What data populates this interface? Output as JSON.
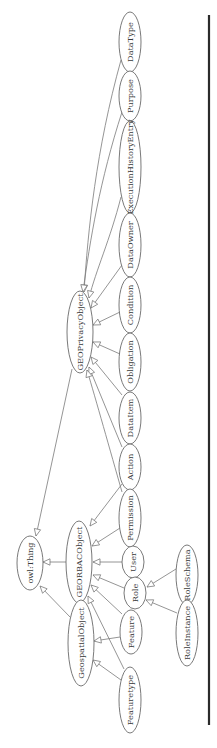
{
  "diagram": {
    "type": "class-hierarchy",
    "orientation": "rotated-90-ccw",
    "root": "owl:Thing",
    "nodes": [
      {
        "id": "owl_thing",
        "label": "owl:Thing",
        "cx": 30,
        "cy": 563,
        "rx": 13,
        "ry": 27
      },
      {
        "id": "geoprivacyobject",
        "label": "GEOPrivacyObject",
        "cx": 80,
        "cy": 332,
        "rx": 13,
        "ry": 41
      },
      {
        "id": "georbacobject",
        "label": "GEORBACObject",
        "cx": 79,
        "cy": 562,
        "rx": 13,
        "ry": 41
      },
      {
        "id": "geospatialobject",
        "label": "GeospatialObject",
        "cx": 81,
        "cy": 643,
        "rx": 13,
        "ry": 43
      },
      {
        "id": "datatype",
        "label": "DataType",
        "cx": 130,
        "cy": 42,
        "rx": 11,
        "ry": 30
      },
      {
        "id": "purpose",
        "label": "Purpose",
        "cx": 130,
        "cy": 96,
        "rx": 11,
        "ry": 25
      },
      {
        "id": "executionhistoryentry",
        "label": "ExecutionHistoryEntry",
        "cx": 130,
        "cy": 167,
        "rx": 11,
        "ry": 46
      },
      {
        "id": "dataowner",
        "label": "DataOwner",
        "cx": 130,
        "cy": 245,
        "rx": 11,
        "ry": 32
      },
      {
        "id": "condition",
        "label": "Condition",
        "cx": 130,
        "cy": 305,
        "rx": 11,
        "ry": 28
      },
      {
        "id": "obligation",
        "label": "Obligation",
        "cx": 130,
        "cy": 362,
        "rx": 11,
        "ry": 29
      },
      {
        "id": "dataitem",
        "label": "DataItem",
        "cx": 130,
        "cy": 418,
        "rx": 11,
        "ry": 26
      },
      {
        "id": "action",
        "label": "Action",
        "cx": 130,
        "cy": 467,
        "rx": 11,
        "ry": 23
      },
      {
        "id": "permission",
        "label": "Permission",
        "cx": 130,
        "cy": 518,
        "rx": 11,
        "ry": 29
      },
      {
        "id": "user",
        "label": "User",
        "cx": 133,
        "cy": 562,
        "rx": 11,
        "ry": 16
      },
      {
        "id": "role",
        "label": "Role",
        "cx": 135,
        "cy": 593,
        "rx": 11,
        "ry": 16
      },
      {
        "id": "feature",
        "label": "Feature",
        "cx": 131,
        "cy": 632,
        "rx": 11,
        "ry": 22
      },
      {
        "id": "featuretype",
        "label": "Featuretype",
        "cx": 130,
        "cy": 700,
        "rx": 11,
        "ry": 33
      },
      {
        "id": "roleschema",
        "label": "RoleSchema",
        "cx": 187,
        "cy": 575,
        "rx": 11,
        "ry": 30
      },
      {
        "id": "roleinstance",
        "label": "RoleInstance",
        "cx": 187,
        "cy": 633,
        "rx": 11,
        "ry": 33
      }
    ],
    "edges": [
      {
        "from": "geoprivacyobject",
        "to": "owl_thing",
        "path": "M72,369 L36,536",
        "tip": [
          36,
          536
        ],
        "angle": 102
      },
      {
        "from": "georbacobject",
        "to": "owl_thing",
        "path": "M66,562 L43,562",
        "tip": [
          43,
          562
        ],
        "angle": 180
      },
      {
        "from": "geospatialobject",
        "to": "owl_thing",
        "path": "M70,617 L40,586",
        "tip": [
          40,
          586
        ],
        "angle": 226
      },
      {
        "from": "datatype",
        "to": "geoprivacyobject",
        "path": "M121,60 C96,150 88,230 84,292",
        "tip": [
          84,
          292
        ],
        "angle": 94
      },
      {
        "from": "purpose",
        "to": "geoprivacyobject",
        "path": "M122,112 C100,180 90,240 83,292",
        "tip": [
          83,
          292
        ],
        "angle": 98
      },
      {
        "from": "executionhistoryentry",
        "to": "geoprivacyobject",
        "path": "M121,197 C110,240 96,270 89,298",
        "tip": [
          89,
          298
        ],
        "angle": 104
      },
      {
        "from": "dataowner",
        "to": "geoprivacyobject",
        "path": "M122,265 L91,308",
        "tip": [
          91,
          308
        ],
        "angle": 126
      },
      {
        "from": "condition",
        "to": "geoprivacyobject",
        "path": "M120,312 L93,325",
        "tip": [
          93,
          325
        ],
        "angle": 154
      },
      {
        "from": "obligation",
        "to": "geoprivacyobject",
        "path": "M120,354 L93,342",
        "tip": [
          93,
          342
        ],
        "angle": 204
      },
      {
        "from": "dataitem",
        "to": "geoprivacyobject",
        "path": "M122,395 L91,357",
        "tip": [
          91,
          357
        ],
        "angle": 231
      },
      {
        "from": "action",
        "to": "geoprivacyobject",
        "path": "M122,447 L89,367",
        "tip": [
          89,
          367
        ],
        "angle": 248
      },
      {
        "from": "permission",
        "to": "geoprivacyobject",
        "path": "M122,492 C110,450 96,400 87,370",
        "tip": [
          87,
          370
        ],
        "angle": 253
      },
      {
        "from": "action",
        "to": "georbacobject",
        "path": "M122,484 L90,526",
        "tip": [
          90,
          526
        ],
        "angle": 127
      },
      {
        "from": "permission",
        "to": "georbacobject",
        "path": "M120,528 L92,546",
        "tip": [
          92,
          546
        ],
        "angle": 147
      },
      {
        "from": "user",
        "to": "georbacobject",
        "path": "M122,562 L93,562",
        "tip": [
          93,
          562
        ],
        "angle": 180
      },
      {
        "from": "role",
        "to": "georbacobject",
        "path": "M124,588 L93,575",
        "tip": [
          93,
          575
        ],
        "angle": 203
      },
      {
        "from": "feature",
        "to": "georbacobject",
        "path": "M122,614 L91,585",
        "tip": [
          91,
          585
        ],
        "angle": 223
      },
      {
        "from": "featuretype",
        "to": "georbacobject",
        "path": "M124,669 L88,596",
        "tip": [
          88,
          596
        ],
        "angle": 244
      },
      {
        "from": "feature",
        "to": "geospatialobject",
        "path": "M120,637 L94,641",
        "tip": [
          94,
          641
        ],
        "angle": 171
      },
      {
        "from": "featuretype",
        "to": "geospatialobject",
        "path": "M121,680 L93,660",
        "tip": [
          93,
          660
        ],
        "angle": 216
      },
      {
        "from": "roleschema",
        "to": "role",
        "path": "M176,569 L147,587",
        "tip": [
          147,
          587
        ],
        "angle": 148
      },
      {
        "from": "roleinstance",
        "to": "role",
        "path": "M177,613 L146,600",
        "tip": [
          146,
          600
        ],
        "angle": 203
      }
    ],
    "separator": {
      "x": 209,
      "y1": 15,
      "y2": 725,
      "color": "#2b2b2b"
    }
  }
}
